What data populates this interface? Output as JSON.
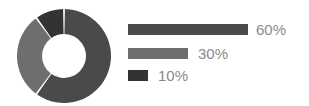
{
  "chart_data": {
    "type": "pie",
    "title": "",
    "subtitle": "",
    "xlabel": "",
    "ylabel": "",
    "variant": "donut",
    "grid": false,
    "legend_position": "right",
    "legend_style": "proportional-bars",
    "labels": [
      "60%",
      "30%",
      "10%"
    ],
    "values": [
      60,
      30,
      10
    ],
    "colors": [
      "#4a4a4a",
      "#6e6e6e",
      "#333333"
    ],
    "slices": [
      {
        "label": "60%",
        "value": 60,
        "color": "#4a4a4a",
        "start_angle": 0,
        "end_angle": 216
      },
      {
        "label": "30%",
        "value": 30,
        "color": "#6e6e6e",
        "start_angle": 216,
        "end_angle": 324
      },
      {
        "label": "10%",
        "value": 10,
        "color": "#333333",
        "start_angle": 324,
        "end_angle": 360
      }
    ],
    "geometry": {
      "center_x": 47,
      "center_y": 47,
      "outer_radius": 47,
      "inner_radius": 22,
      "gap_degrees": 2.2,
      "start_at": "top",
      "direction": "clockwise"
    }
  },
  "legend": {
    "bar_max_width": 120,
    "items": [
      {
        "label": "60%",
        "value": 60,
        "bar_width": 120,
        "color": "#4a4a4a"
      },
      {
        "label": "30%",
        "value": 30,
        "bar_width": 60,
        "color": "#6e6e6e"
      },
      {
        "label": "10%",
        "value": 10,
        "bar_width": 20,
        "color": "#333333"
      }
    ]
  },
  "colors": {
    "background": "#ffffff",
    "text": "#8a8a8a",
    "series_1": "#4a4a4a",
    "series_2": "#6e6e6e",
    "series_3": "#333333"
  }
}
